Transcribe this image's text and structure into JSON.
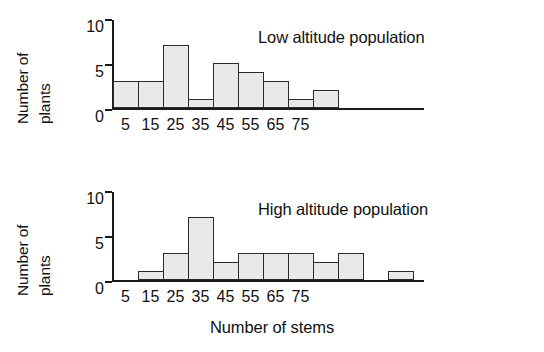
{
  "figure": {
    "xlabel": "Number of stems",
    "ylabel_line1": "Number of",
    "ylabel_line2": "plants"
  },
  "chart_data": [
    {
      "type": "bar",
      "title": "Low altitude population",
      "xlabel": "Number of stems",
      "ylabel": "Number of plants",
      "bin_width": 10,
      "bin_edges": [
        0,
        10,
        20,
        30,
        40,
        50,
        60,
        70,
        80
      ],
      "categories": [
        "5",
        "15",
        "25",
        "35",
        "45",
        "55",
        "65",
        "75"
      ],
      "bin_centers": [
        5,
        15,
        25,
        35,
        45,
        55,
        65,
        75
      ],
      "bins": [
        {
          "range": "0-10",
          "center": 5,
          "value": 3
        },
        {
          "range": "10-20",
          "center": 15,
          "value": 3
        },
        {
          "range": "20-30",
          "center": 25,
          "value": 7
        },
        {
          "range": "30-40",
          "center": 35,
          "value": 1
        },
        {
          "range": "40-50",
          "center": 45,
          "value": 5
        },
        {
          "range": "50-60",
          "center": 55,
          "value": 4
        },
        {
          "range": "60-70",
          "center": 65,
          "value": 3
        },
        {
          "range": "70-80",
          "center": 75,
          "value": 1
        },
        {
          "range": "80-90",
          "center": 85,
          "value": 2
        },
        {
          "range": "90-100",
          "center": 95,
          "value": 0
        },
        {
          "range": "100-110",
          "center": 105,
          "value": 0
        },
        {
          "range": "110-120",
          "center": 115,
          "value": 0
        }
      ],
      "values": [
        3,
        3,
        7,
        1,
        5,
        4,
        3,
        1,
        2,
        0,
        0,
        0
      ],
      "ylim": [
        0,
        10
      ],
      "yticks": [
        0,
        5,
        10
      ],
      "xlim": [
        0,
        80
      ],
      "grid": false,
      "legend": "none"
    },
    {
      "type": "bar",
      "title": "High altitude population",
      "xlabel": "Number of stems",
      "ylabel": "Number of plants",
      "bin_width": 10,
      "bin_edges": [
        0,
        10,
        20,
        30,
        40,
        50,
        60,
        70,
        80
      ],
      "categories": [
        "5",
        "15",
        "25",
        "35",
        "45",
        "55",
        "65",
        "75"
      ],
      "bin_centers": [
        5,
        15,
        25,
        35,
        45,
        55,
        65,
        75
      ],
      "bins": [
        {
          "range": "0-10",
          "center": 5,
          "value": 0
        },
        {
          "range": "10-20",
          "center": 15,
          "value": 1
        },
        {
          "range": "20-30",
          "center": 25,
          "value": 3
        },
        {
          "range": "30-40",
          "center": 35,
          "value": 7
        },
        {
          "range": "40-50",
          "center": 45,
          "value": 2
        },
        {
          "range": "50-60",
          "center": 55,
          "value": 3
        },
        {
          "range": "60-70",
          "center": 65,
          "value": 3
        },
        {
          "range": "70-80",
          "center": 75,
          "value": 3
        },
        {
          "range": "80-90",
          "center": 85,
          "value": 2
        },
        {
          "range": "90-100",
          "center": 95,
          "value": 3
        },
        {
          "range": "100-110",
          "center": 105,
          "value": 0
        },
        {
          "range": "110-120",
          "center": 115,
          "value": 1
        }
      ],
      "values": [
        0,
        1,
        3,
        7,
        2,
        3,
        3,
        3,
        2,
        3,
        0,
        1
      ],
      "ylim": [
        0,
        10
      ],
      "yticks": [
        0,
        5,
        10
      ],
      "xlim": [
        0,
        80
      ],
      "grid": false,
      "legend": "none"
    }
  ],
  "style": {
    "bar_fill": "#e9e9e9",
    "bar_stroke": "#2b2b2b",
    "axis_color": "#1a1a1a",
    "text_color": "#111111",
    "background": "#ffffff"
  },
  "panels": {
    "low": {
      "title": "Low altitude population",
      "yticks": [
        "0",
        "5",
        "10"
      ],
      "xticks": [
        "5",
        "15",
        "25",
        "35",
        "45",
        "55",
        "65",
        "75"
      ]
    },
    "high": {
      "title": "High altitude population",
      "yticks": [
        "0",
        "5",
        "10"
      ],
      "xticks": [
        "5",
        "15",
        "25",
        "35",
        "45",
        "55",
        "65",
        "75"
      ]
    }
  }
}
